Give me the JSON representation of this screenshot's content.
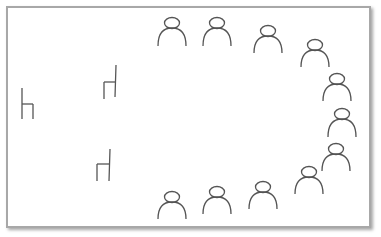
{
  "diagram": {
    "stroke_color": "#555555",
    "frame_color": "#a8a8a8",
    "people": [
      {
        "id": 1,
        "cx": 172,
        "cy": 23,
        "base_y": 46
      },
      {
        "id": 2,
        "cx": 217,
        "cy": 23,
        "base_y": 46
      },
      {
        "id": 3,
        "cx": 268,
        "cy": 31,
        "base_y": 53
      },
      {
        "id": 4,
        "cx": 315,
        "cy": 45,
        "base_y": 67
      },
      {
        "id": 5,
        "cx": 337,
        "cy": 79,
        "base_y": 101
      },
      {
        "id": 6,
        "cx": 342,
        "cy": 114,
        "base_y": 137
      },
      {
        "id": 7,
        "cx": 336,
        "cy": 149,
        "base_y": 171
      },
      {
        "id": 8,
        "cx": 309,
        "cy": 172,
        "base_y": 194
      },
      {
        "id": 9,
        "cx": 263,
        "cy": 187,
        "base_y": 209
      },
      {
        "id": 10,
        "cx": 217,
        "cy": 192,
        "base_y": 214
      },
      {
        "id": 11,
        "cx": 172,
        "cy": 197,
        "base_y": 219
      }
    ],
    "chairs": [
      {
        "id": 1,
        "back": [
          [
            22,
            88
          ],
          [
            22,
            119
          ]
        ],
        "seat": [
          [
            22,
            104
          ],
          [
            33,
            104
          ]
        ],
        "leg": [
          [
            33,
            104
          ],
          [
            33,
            119
          ]
        ]
      },
      {
        "id": 2,
        "back": [
          [
            116,
            65
          ],
          [
            115,
            97
          ]
        ],
        "seat": [
          [
            104,
            82
          ],
          [
            116,
            82
          ]
        ],
        "leg": [
          [
            104,
            82
          ],
          [
            104,
            99
          ]
        ]
      },
      {
        "id": 3,
        "back": [
          [
            110,
            149
          ],
          [
            109,
            181
          ]
        ],
        "seat": [
          [
            97,
            164
          ],
          [
            109,
            164
          ]
        ],
        "leg": [
          [
            97,
            164
          ],
          [
            97,
            181
          ]
        ]
      }
    ]
  }
}
